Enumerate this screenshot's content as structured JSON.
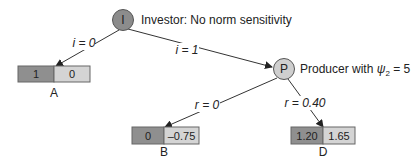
{
  "nodes": {
    "investor": {
      "letter": "I",
      "description": "Investor: No norm sensitivity",
      "fill": "#8c8c8c"
    },
    "producer": {
      "letter": "P",
      "description_prefix": "Producer with ",
      "symbol": "ψ",
      "subscript": "2",
      "description_suffix": " = 5",
      "fill": "#cfcfcf"
    }
  },
  "edges": [
    {
      "from": "I",
      "to": "A",
      "label": "i = 0"
    },
    {
      "from": "I",
      "to": "P",
      "label": "i = 1"
    },
    {
      "from": "P",
      "to": "B",
      "label": "r = 0"
    },
    {
      "from": "P",
      "to": "D",
      "label": "r = 0.40"
    }
  ],
  "leaves": [
    {
      "label": "A",
      "investor_payoff": "1",
      "producer_payoff": "0"
    },
    {
      "label": "B",
      "investor_payoff": "0",
      "producer_payoff": "–0.75"
    },
    {
      "label": "D",
      "investor_payoff": "1.20",
      "producer_payoff": "1.65"
    }
  ],
  "colors": {
    "investor_payoff_fill": "#8f8f8f",
    "producer_payoff_fill": "#d4d4d4",
    "edge": "#333333"
  }
}
